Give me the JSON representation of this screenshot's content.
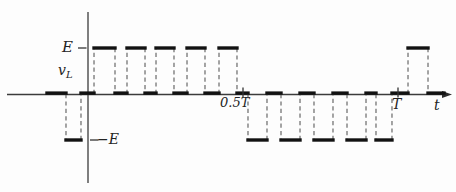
{
  "figure": {
    "background": "#fdfdfd",
    "axis_color": "#3c3c3c",
    "waveform_color": "#121212",
    "dash_color": "#5c5c5c",
    "text_color": "#242424"
  },
  "labels": {
    "E": "E",
    "negE": "−E",
    "v_symbol": "v",
    "v_subscript": "L",
    "half_T": "0.5T",
    "T": "T",
    "t": "t"
  },
  "layout": {
    "origin_x": 88,
    "origin_y": 94,
    "T_px": 310,
    "E_px": 46,
    "h_axis_x0": 7,
    "h_axis_x1": 443,
    "arrow_len": 9,
    "v_axis_y0": 12,
    "v_axis_y1": 183
  },
  "chart_data": {
    "type": "line",
    "subtype": "step-pwm-waveform",
    "xlabel": "t",
    "ylabel": "vL",
    "x_unit": "T",
    "y_unit": "E",
    "ylim": [
      -1,
      1
    ],
    "x_axis_range_T": [
      -0.26,
      1.17
    ],
    "grid": false,
    "x_ticks": [
      {
        "t": 0.5,
        "label": "0.5T"
      },
      {
        "t": 1.0,
        "label": "T"
      }
    ],
    "y_ticks": [
      {
        "v": 1,
        "label": "E",
        "side": "left"
      },
      {
        "v": -1,
        "label": "−E",
        "side": "right"
      }
    ],
    "segments": [
      {
        "t0": -0.1323,
        "t1": -0.071,
        "v": 0
      },
      {
        "t0": -0.071,
        "t1": -0.0226,
        "v": -1
      },
      {
        "t0": -0.0226,
        "t1": 0.0194,
        "v": 0
      },
      {
        "t0": 0.0194,
        "t1": 0.0871,
        "v": 1
      },
      {
        "t0": 0.0871,
        "t1": 0.1258,
        "v": 0
      },
      {
        "t0": 0.1258,
        "t1": 0.1839,
        "v": 1
      },
      {
        "t0": 0.1839,
        "t1": 0.2194,
        "v": 0
      },
      {
        "t0": 0.2194,
        "t1": 0.2774,
        "v": 1
      },
      {
        "t0": 0.2774,
        "t1": 0.3194,
        "v": 0
      },
      {
        "t0": 0.3194,
        "t1": 0.3774,
        "v": 1
      },
      {
        "t0": 0.3774,
        "t1": 0.4226,
        "v": 0
      },
      {
        "t0": 0.4226,
        "t1": 0.4806,
        "v": 1
      },
      {
        "t0": 0.4806,
        "t1": 0.5161,
        "v": 0
      },
      {
        "t0": 0.5161,
        "t1": 0.5774,
        "v": -1
      },
      {
        "t0": 0.5774,
        "t1": 0.6226,
        "v": 0
      },
      {
        "t0": 0.6226,
        "t1": 0.6839,
        "v": -1
      },
      {
        "t0": 0.6839,
        "t1": 0.729,
        "v": 0
      },
      {
        "t0": 0.729,
        "t1": 0.7903,
        "v": -1
      },
      {
        "t0": 0.7903,
        "t1": 0.8355,
        "v": 0
      },
      {
        "t0": 0.8355,
        "t1": 0.8968,
        "v": -1
      },
      {
        "t0": 0.8968,
        "t1": 0.929,
        "v": 0
      },
      {
        "t0": 0.929,
        "t1": 0.9806,
        "v": -1
      },
      {
        "t0": 0.9806,
        "t1": 1.0323,
        "v": 0
      },
      {
        "t0": 1.0323,
        "t1": 1.0968,
        "v": 1
      },
      {
        "t0": 1.0968,
        "t1": 1.1484,
        "v": 0
      }
    ]
  }
}
